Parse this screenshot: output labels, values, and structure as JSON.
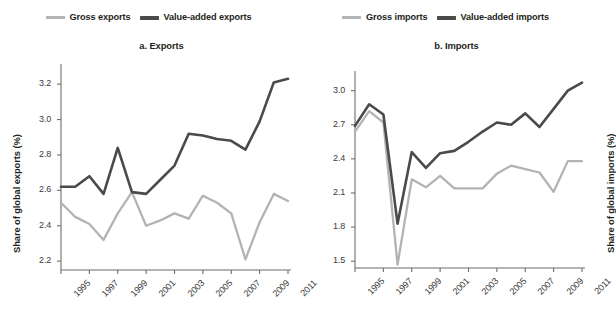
{
  "figure": {
    "width": 594,
    "height": 326,
    "background": "#ffffff"
  },
  "colors": {
    "gross": "#b3b3b3",
    "value_added": "#4a4a4a",
    "axis": "#6d6d6d",
    "text": "#231f20"
  },
  "panels": [
    {
      "id": "exports",
      "title": "a. Exports",
      "legend": [
        {
          "label": "Gross exports",
          "color": "#b3b3b3",
          "swatch": "line-swatch"
        },
        {
          "label": "Value-added exports",
          "color": "#4a4a4a",
          "swatch": "line-swatch"
        }
      ],
      "ylabel": "Share of global exports (%)",
      "yticks": [
        "3.2",
        "3.0",
        "2.8",
        "2.6",
        "2.4",
        "2.2"
      ],
      "xticks": [
        "1995",
        "1997",
        "1999",
        "2001",
        "2003",
        "2005",
        "2007",
        "2009",
        "2011"
      ]
    },
    {
      "id": "imports",
      "title": "b. Imports",
      "legend": [
        {
          "label": "Gross imports",
          "color": "#b3b3b3",
          "swatch": "line-swatch"
        },
        {
          "label": "Value-added imports",
          "color": "#4a4a4a",
          "swatch": "line-swatch"
        }
      ],
      "ylabel": "Share of global imports (%)",
      "yticks": [
        "3.0",
        "2.7",
        "2.4",
        "2.1",
        "1.8",
        "1.5"
      ],
      "xticks": [
        "1995",
        "1997",
        "1999",
        "2001",
        "2003",
        "2005",
        "2007",
        "2009",
        "2011"
      ]
    }
  ],
  "chart_data": [
    {
      "type": "line",
      "title": "a. Exports",
      "xlabel": "",
      "ylabel": "Share of global exports (%)",
      "x": [
        1995,
        1996,
        1997,
        1998,
        1999,
        2000,
        2001,
        2002,
        2003,
        2004,
        2005,
        2006,
        2007,
        2008,
        2009,
        2010,
        2011
      ],
      "ylim": [
        2.15,
        3.28
      ],
      "xlim": [
        1995,
        2011
      ],
      "ytick_values": [
        2.2,
        2.4,
        2.6,
        2.8,
        3.0,
        3.2
      ],
      "xtick_values": [
        1995,
        1997,
        1999,
        2001,
        2003,
        2005,
        2007,
        2009,
        2011
      ],
      "grid": false,
      "legend_position": "top-center",
      "series": [
        {
          "name": "Gross exports",
          "color": "#b3b3b3",
          "values": [
            2.53,
            2.45,
            2.41,
            2.32,
            2.47,
            2.59,
            2.4,
            2.43,
            2.47,
            2.44,
            2.57,
            2.53,
            2.47,
            2.21,
            2.42,
            2.58,
            2.54
          ]
        },
        {
          "name": "Value-added exports",
          "color": "#4a4a4a",
          "values": [
            2.62,
            2.62,
            2.68,
            2.58,
            2.84,
            2.59,
            2.58,
            2.66,
            2.74,
            2.92,
            2.91,
            2.89,
            2.88,
            2.83,
            2.99,
            3.21,
            3.23
          ]
        }
      ]
    },
    {
      "type": "line",
      "title": "b. Imports",
      "xlabel": "",
      "ylabel": "Share of global imports (%)",
      "x": [
        1995,
        1996,
        1997,
        1998,
        1999,
        2000,
        2001,
        2002,
        2003,
        2004,
        2005,
        2006,
        2007,
        2008,
        2009,
        2010,
        2011
      ],
      "ylim": [
        1.44,
        3.12
      ],
      "xlim": [
        1995,
        2011
      ],
      "ytick_values": [
        1.5,
        1.8,
        2.1,
        2.4,
        2.7,
        3.0
      ],
      "xtick_values": [
        1995,
        1997,
        1999,
        2001,
        2003,
        2005,
        2007,
        2009,
        2011
      ],
      "grid": false,
      "legend_position": "top-center",
      "series": [
        {
          "name": "Gross imports",
          "color": "#b3b3b3",
          "values": [
            2.64,
            2.82,
            2.72,
            1.47,
            2.22,
            2.15,
            2.25,
            2.14,
            2.14,
            2.14,
            2.27,
            2.34,
            2.31,
            2.28,
            2.11,
            2.38,
            2.38
          ]
        },
        {
          "name": "Value-added imports",
          "color": "#4a4a4a",
          "values": [
            2.69,
            2.88,
            2.79,
            1.83,
            2.46,
            2.32,
            2.45,
            2.47,
            2.55,
            2.64,
            2.72,
            2.7,
            2.8,
            2.68,
            2.84,
            3.0,
            3.07
          ]
        }
      ]
    }
  ]
}
